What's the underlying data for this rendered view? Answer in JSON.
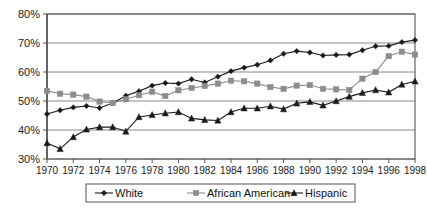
{
  "chart_data": {
    "type": "line",
    "title": "",
    "subtitle": "",
    "xlabel": "",
    "ylabel": "",
    "xlim": [
      1970,
      1998
    ],
    "ylim": [
      30,
      80
    ],
    "ytick_labels": [
      "80%",
      "70%",
      "60%",
      "50%",
      "40%",
      "30%"
    ],
    "ytick_values": [
      80,
      70,
      60,
      50,
      40,
      30
    ],
    "xtick_labels": [
      "1970",
      "1972",
      "1974",
      "1976",
      "1978",
      "1980",
      "1982",
      "1984",
      "1986",
      "1988",
      "1990",
      "1992",
      "1994",
      "1996",
      "1998"
    ],
    "xtick_values": [
      1970,
      1972,
      1974,
      1976,
      1978,
      1980,
      1982,
      1984,
      1986,
      1988,
      1990,
      1992,
      1994,
      1996,
      1998
    ],
    "grid": true,
    "grid_axis": "y",
    "legend_position": "bottom",
    "x": [
      1970,
      1971,
      1972,
      1973,
      1974,
      1975,
      1976,
      1977,
      1978,
      1979,
      1980,
      1981,
      1982,
      1983,
      1984,
      1985,
      1986,
      1987,
      1988,
      1989,
      1990,
      1991,
      1992,
      1993,
      1994,
      1995,
      1996,
      1997,
      1998
    ],
    "series": [
      {
        "name": "White",
        "marker": "diamond",
        "color": "#1a1a1a",
        "values": [
          45.5,
          46.8,
          47.8,
          48.3,
          47.6,
          49.3,
          51.8,
          53.4,
          55.3,
          56.2,
          56.0,
          57.5,
          56.4,
          58.4,
          60.3,
          61.5,
          62.5,
          64.0,
          66.3,
          67.2,
          66.7,
          65.7,
          65.9,
          66.0,
          67.5,
          68.9,
          69.0,
          70.3,
          71.0
        ]
      },
      {
        "name": "African American",
        "marker": "square",
        "color": "#8c8c8c",
        "values": [
          53.5,
          52.5,
          52.2,
          51.5,
          49.8,
          49.3,
          50.6,
          52.0,
          53.2,
          51.7,
          53.7,
          54.5,
          55.2,
          56.0,
          57.0,
          56.8,
          56.0,
          54.8,
          54.2,
          55.3,
          55.5,
          54.2,
          54.0,
          53.8,
          57.7,
          60.0,
          65.5,
          67.0,
          66.0
        ]
      },
      {
        "name": "Hispanic",
        "marker": "triangle",
        "color": "#1a1a1a",
        "values": [
          35.5,
          33.5,
          37.6,
          40.2,
          41.0,
          41.0,
          39.5,
          44.5,
          45.2,
          45.8,
          46.2,
          44.0,
          43.5,
          43.3,
          46.2,
          47.5,
          47.5,
          48.2,
          47.2,
          49.2,
          49.7,
          48.5,
          50.0,
          51.5,
          52.8,
          53.8,
          53.0,
          55.7,
          56.8
        ]
      }
    ]
  },
  "legend": {
    "items": [
      {
        "label": "White"
      },
      {
        "label": "African American"
      },
      {
        "label": "Hispanic"
      }
    ]
  }
}
